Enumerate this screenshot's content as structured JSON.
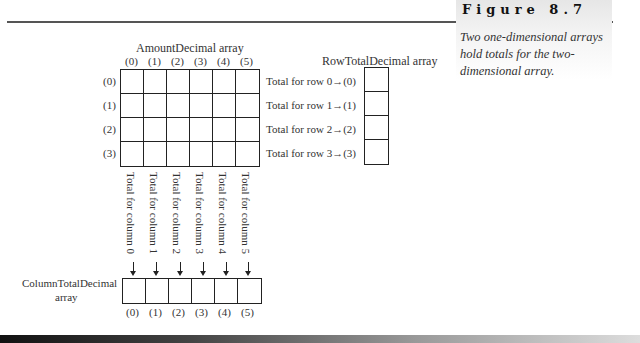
{
  "figure": {
    "title": "Figure 8.7",
    "caption": "Two one-dimensional arrays hold totals for the two-dimensional array."
  },
  "main_array": {
    "title": "AmountDecimal array",
    "column_indices": [
      "(0)",
      "(1)",
      "(2)",
      "(3)",
      "(4)",
      "(5)"
    ],
    "row_indices": [
      "(0)",
      "(1)",
      "(2)",
      "(3)"
    ],
    "rows": 4,
    "cols": 6
  },
  "row_total_array": {
    "title": "RowTotalDecimal array",
    "labels": [
      "Total for row 0",
      "Total for row 1",
      "Total for row 2",
      "Total for row 3"
    ],
    "indices": [
      "(0)",
      "(1)",
      "(2)",
      "(3)"
    ],
    "arrow": "→"
  },
  "column_total_array": {
    "title_line1": "ColumnTotalDecimal",
    "title_line2": "array",
    "labels": [
      "Total for column 0",
      "Total for column 1",
      "Total for column 2",
      "Total for column 3",
      "Total for column 4",
      "Total for column 5"
    ],
    "indices": [
      "(0)",
      "(1)",
      "(2)",
      "(3)",
      "(4)",
      "(5)"
    ]
  }
}
